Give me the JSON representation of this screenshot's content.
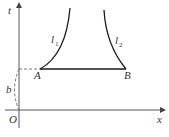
{
  "diagram": {
    "axes": {
      "vertical_label": "t",
      "horizontal_label": "x",
      "origin_label": "O"
    },
    "points": {
      "A": "A",
      "B": "B"
    },
    "curves": {
      "l1_main": "l",
      "l1_sub": "1",
      "l2_main": "l",
      "l2_sub": "2"
    },
    "distance_label": "b",
    "colors": {
      "line": "#1a1a1a",
      "axis": "#555555",
      "dashed": "#777777"
    }
  }
}
